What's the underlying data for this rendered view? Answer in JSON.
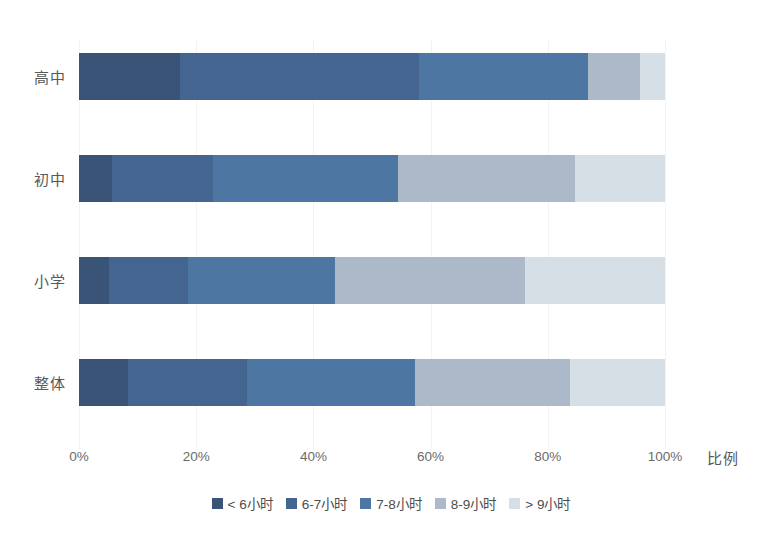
{
  "chart_data": {
    "type": "bar",
    "orientation": "horizontal",
    "stacked": true,
    "normalized": true,
    "title": "",
    "xlabel": "比例",
    "ylabel": "",
    "xlim": [
      0,
      100
    ],
    "xticks": [
      "0%",
      "20%",
      "40%",
      "60%",
      "80%",
      "100%"
    ],
    "xtick_values": [
      0,
      20,
      40,
      60,
      80,
      100
    ],
    "grid": true,
    "legend_position": "bottom",
    "categories": [
      "高中",
      "初中",
      "小学",
      "整体"
    ],
    "series": [
      {
        "name": "< 6小时",
        "color": "#3a5478",
        "values": [
          17.2,
          5.6,
          5.1,
          8.4
        ]
      },
      {
        "name": "6-7小时",
        "color": "#43658f",
        "values": [
          40.8,
          17.3,
          13.5,
          20.3
        ]
      },
      {
        "name": "7-8小时",
        "color": "#4d76a3",
        "values": [
          28.9,
          31.5,
          25.1,
          28.6
        ]
      },
      {
        "name": "8-9小时",
        "color": "#abb9c9",
        "values": [
          8.9,
          30.2,
          32.4,
          26.5
        ]
      },
      {
        "name": "> 9小时",
        "color": "#d6dee6",
        "values": [
          4.2,
          15.4,
          23.9,
          16.2
        ]
      }
    ]
  },
  "axis": {
    "x_title": "比例"
  }
}
